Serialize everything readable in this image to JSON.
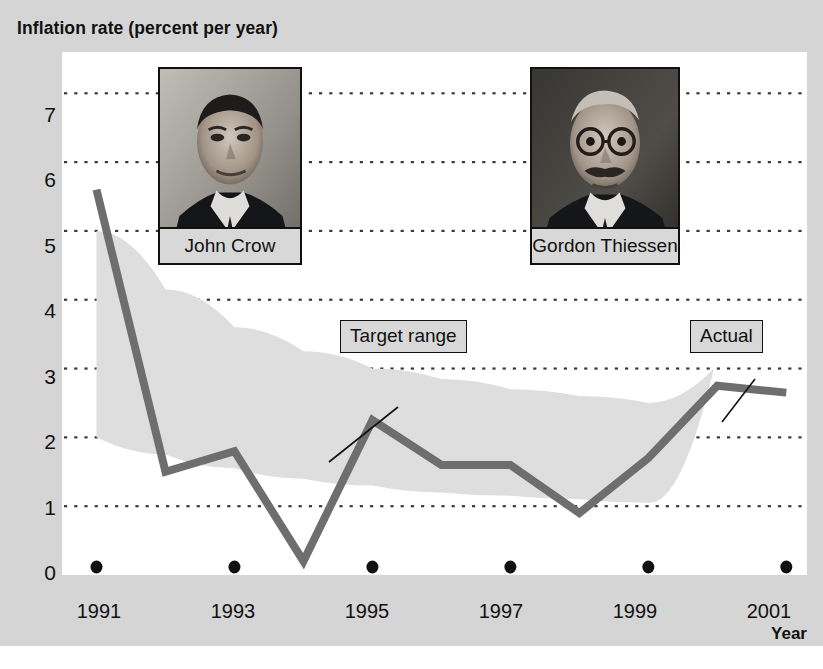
{
  "chart_data": {
    "type": "line",
    "title": "Inflation rate (percent per year)",
    "xlabel": "Year",
    "ylabel": "Inflation rate (percent per year)",
    "xlim": [
      1990.5,
      2001.3
    ],
    "ylim": [
      0,
      7.6
    ],
    "grid": true,
    "grid_style": "dotted-horizontal",
    "legend_position": "inline-callouts",
    "x_tick_labels": [
      "1991",
      "1993",
      "1995",
      "1997",
      "1999",
      "2001"
    ],
    "x_tick_values": [
      1991,
      1993,
      1995,
      1997,
      1999,
      2001
    ],
    "y_tick_labels": [
      "0",
      "1",
      "2",
      "3",
      "4",
      "5",
      "6",
      "7"
    ],
    "y_tick_values": [
      0,
      1,
      2,
      3,
      4,
      5,
      6,
      7
    ],
    "x": [
      1991,
      1992,
      1993,
      1994,
      1995,
      1996,
      1997,
      1998,
      1999,
      2000,
      2001
    ],
    "series": [
      {
        "name": "Actual",
        "values": [
          5.6,
          1.5,
          1.8,
          0.2,
          2.25,
          1.6,
          1.6,
          0.9,
          1.7,
          2.75,
          2.65
        ],
        "color": "#6e6e6e"
      }
    ],
    "band": {
      "name": "Target range",
      "color": "#dedede",
      "x": [
        1991,
        1992,
        1993,
        1994,
        1995,
        1996,
        1997,
        1998,
        1999,
        1999.95
      ],
      "lower": [
        2.0,
        1.75,
        1.55,
        1.4,
        1.3,
        1.2,
        1.15,
        1.1,
        1.05,
        1.0
      ],
      "upper": [
        5.0,
        4.15,
        3.6,
        3.25,
        3.0,
        2.85,
        2.7,
        2.6,
        2.5,
        3.0
      ]
    },
    "annotations": [
      {
        "label": "Target range",
        "target_x": 1993.9,
        "target_y": 2.85
      },
      {
        "label": "Actual",
        "target_x": 2000.0,
        "target_y": 2.75
      }
    ],
    "photos": [
      {
        "caption": "John Crow"
      },
      {
        "caption": "Gordon Thiessen"
      }
    ]
  },
  "colors": {
    "background": "#d5d5d5",
    "plot_background": "#ffffff",
    "line": "#6e6e6e",
    "band": "#dedede",
    "text": "#111111",
    "grid_dot": "#3a3a3a"
  }
}
